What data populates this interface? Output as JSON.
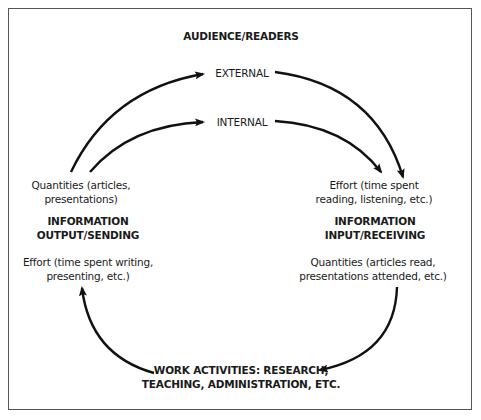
{
  "diagram": {
    "title": "AUDIENCE/READERS",
    "audience": {
      "external": "EXTERNAL",
      "internal": "INTERNAL"
    },
    "output": {
      "quantities_line1": "Quantities (articles,",
      "quantities_line2": "presentations)",
      "heading_line1": "INFORMATION",
      "heading_line2": "OUTPUT/SENDING",
      "effort_line1": "Effort (time spent writing,",
      "effort_line2": "presenting, etc.)"
    },
    "input": {
      "effort_line1": "Effort (time spent",
      "effort_line2": "reading, listening, etc.)",
      "heading_line1": "INFORMATION",
      "heading_line2": "INPUT/RECEIVING",
      "quantities_line1": "Quantities (articles read,",
      "quantities_line2": "presentations attended, etc.)"
    },
    "work": {
      "line1": "WORK ACTIVITIES: RESEARCH,",
      "line2": "TEACHING, ADMINISTRATION, ETC."
    },
    "flows": [
      {
        "from": "output",
        "to": "external"
      },
      {
        "from": "output",
        "to": "internal"
      },
      {
        "from": "external",
        "to": "input"
      },
      {
        "from": "internal",
        "to": "input"
      },
      {
        "from": "input",
        "to": "work"
      },
      {
        "from": "work",
        "to": "output"
      }
    ],
    "colors": {
      "stroke": "#111111",
      "border": "#555555",
      "background": "#ffffff"
    }
  }
}
